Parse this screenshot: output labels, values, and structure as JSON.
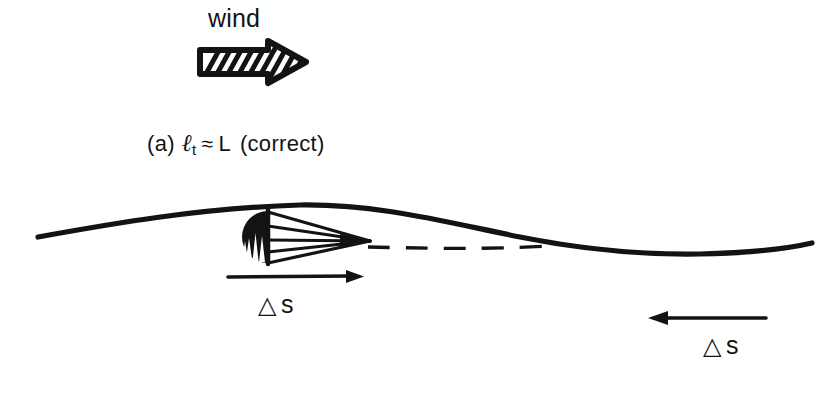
{
  "figure": {
    "background": "#ffffff",
    "ink": "#131313",
    "width": 839,
    "height": 395
  },
  "wind": {
    "label": "wind",
    "direction": "right",
    "arrow_icon": "hatched-block-arrow-right-icon"
  },
  "case": {
    "enumerator": "(a)",
    "symbol_ell": "ℓ",
    "symbol_sub": "t",
    "relation": "≈",
    "symbol_L": "L",
    "qualifier": "(correct)",
    "full_text": "(a) ℓt ≈ L  (correct)"
  },
  "wave": {
    "name": "wave-surface-profile",
    "style": "solid",
    "crest_x": 300,
    "trough_x": 700
  },
  "wake": {
    "name": "dashed-wake-line",
    "style": "dashed"
  },
  "drogue": {
    "name": "parachute-drogue",
    "canopy_icon": "filled-half-dome-icon",
    "rigging_icon": "converging-shroud-lines-icon"
  },
  "displacement": {
    "left": {
      "symbol": "△",
      "variable": "s",
      "label": "△ s",
      "arrow_direction": "right",
      "arrow_icon": "thin-arrow-right-icon"
    },
    "right": {
      "symbol": "△",
      "variable": "s",
      "label": "△ s",
      "arrow_direction": "left",
      "arrow_icon": "thin-arrow-left-icon"
    }
  }
}
